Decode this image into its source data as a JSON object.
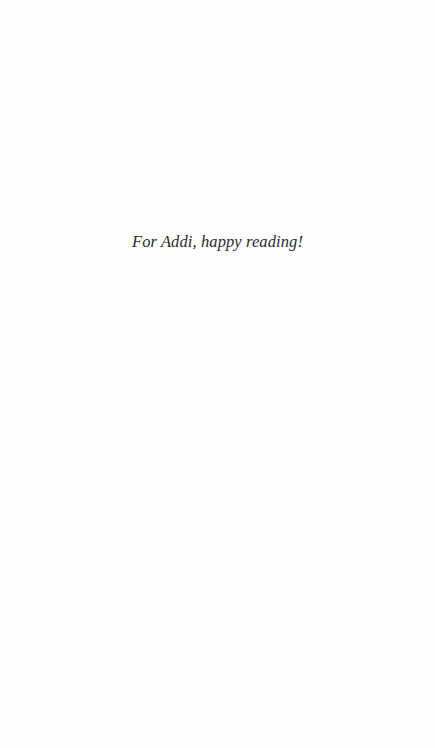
{
  "page": {
    "dedication": "For Addi, happy reading!"
  },
  "colors": {
    "background": "#fefefe",
    "text": "#2a2a2a"
  }
}
